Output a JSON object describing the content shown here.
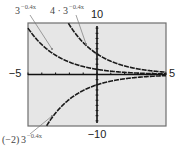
{
  "chart_data": {
    "type": "line",
    "title": "",
    "xlabel": "",
    "ylabel": "",
    "xlim": [
      -5,
      5
    ],
    "ylim": [
      -10,
      10
    ],
    "x_tick_step": 1,
    "y_tick_step": 1,
    "grid": false,
    "window_labels": {
      "xmin": "−5",
      "xmax": "5",
      "ymin": "−10",
      "ymax": "10"
    },
    "series": [
      {
        "name": "3^(−0.4x)",
        "coef": 1,
        "base": 3,
        "k": -0.4,
        "label_base": "3",
        "label_prefix": "",
        "label_exp": "−0.4x"
      },
      {
        "name": "4 · 3^(−0.4x)",
        "coef": 4,
        "base": 3,
        "k": -0.4,
        "label_base": "3",
        "label_prefix": "4 · ",
        "label_exp": "−0.4x"
      },
      {
        "name": "(−2)3^(−0.4x)",
        "coef": -2,
        "base": 3,
        "k": -0.4,
        "label_base": "3",
        "label_prefix": "(−2)",
        "label_exp": "−0.4x"
      }
    ]
  },
  "colors": {
    "screen_bg": "#e6e6e6",
    "screen_border": "#6e6e6e",
    "axis": "#111111",
    "curve": "#1a1a1a",
    "leader": "#777777"
  }
}
